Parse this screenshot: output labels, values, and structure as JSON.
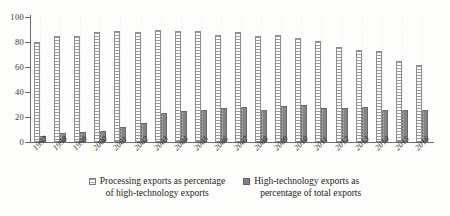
{
  "chart_data": {
    "type": "bar",
    "title": "",
    "xlabel": "",
    "ylabel": "",
    "ylim": [
      0,
      100
    ],
    "yticks": [
      0,
      20,
      40,
      60,
      80,
      100
    ],
    "grid": "vertical-dotted",
    "legend_position": "bottom",
    "categories": [
      "1997",
      "1998",
      "1999",
      "2000",
      "2001",
      "2002",
      "2003",
      "2004",
      "2005",
      "2006",
      "2007",
      "2008",
      "2009",
      "2010",
      "2011",
      "2012",
      "2013",
      "2014",
      "2015",
      "2016"
    ],
    "series": [
      {
        "name": "Processing exports as percentage of high-technology exports",
        "name_line1": "Processing exports as percentage",
        "name_line2": "of high-technology exports",
        "marker": "light-hatched-square",
        "color": "#ffffff",
        "values": [
          80,
          85,
          85,
          88,
          89,
          88,
          90,
          89,
          89,
          86,
          88,
          85,
          86,
          83,
          81,
          76,
          74,
          73,
          65,
          62
        ]
      },
      {
        "name": "High-technology exports as percentage of total exports",
        "name_line1": "High-technology exports as",
        "name_line2": "percentage of total exports",
        "marker": "dark-solid-square",
        "color": "#8b8b8b",
        "values": [
          5,
          7,
          8,
          9,
          12,
          15,
          23,
          25,
          26,
          27,
          28,
          26,
          29,
          30,
          27,
          27,
          28,
          26,
          26,
          26
        ]
      }
    ]
  },
  "axis": {
    "y_tick_labels": [
      "0",
      "20",
      "40",
      "60",
      "80",
      "100"
    ]
  }
}
